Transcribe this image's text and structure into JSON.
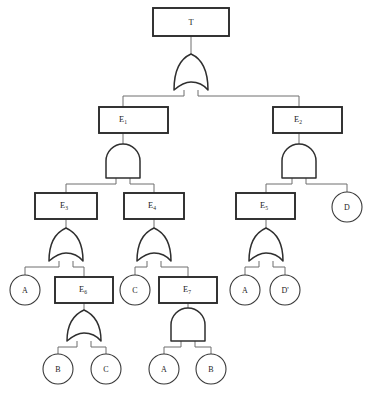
{
  "diagram": {
    "type": "fault-tree"
  },
  "nodes": {
    "top": {
      "label": "T",
      "sub": ""
    },
    "e1": {
      "label": "E",
      "sub": "1"
    },
    "e2": {
      "label": "E",
      "sub": "2"
    },
    "e3": {
      "label": "E",
      "sub": "3"
    },
    "e4": {
      "label": "E",
      "sub": "4"
    },
    "e5": {
      "label": "E",
      "sub": "5"
    },
    "e6": {
      "label": "E",
      "sub": "6"
    },
    "e7": {
      "label": "E",
      "sub": "7"
    }
  },
  "basic_events": {
    "a_left": "A",
    "c_mid": "C",
    "a_right": "A",
    "dprime_right": "D'",
    "d_top_right": "D",
    "b_bottom_left": "B",
    "c_bottom_left": "C",
    "a_bottom_mid": "A",
    "b_bottom_mid": "B"
  },
  "gates": {
    "g_top": "OR",
    "g_e1": "AND",
    "g_e2": "AND",
    "g_e3": "OR",
    "g_e4": "OR",
    "g_e5": "OR",
    "g_e6": "OR",
    "g_e7": "AND"
  },
  "colors": {
    "box_stroke": "#2b2b2b",
    "circle_stroke": "#3a3a3a",
    "gate_stroke": "#2f2f2f",
    "edge_stroke": "#6f6f6f",
    "background": "#ffffff",
    "text": "#1c1c1c"
  }
}
